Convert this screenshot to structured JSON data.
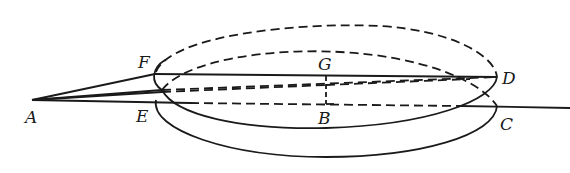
{
  "diagram": {
    "type": "geometry-figure",
    "points": {
      "A": {
        "label": "A",
        "x": 32,
        "y": 100
      },
      "F": {
        "label": "F",
        "x": 155,
        "y": 74
      },
      "E": {
        "label": "E",
        "x": 155,
        "y": 103
      },
      "G": {
        "label": "G",
        "x": 326,
        "y": 75
      },
      "B": {
        "label": "B",
        "x": 326,
        "y": 104
      },
      "D": {
        "label": "D",
        "x": 497,
        "y": 77
      },
      "C": {
        "label": "C",
        "x": 497,
        "y": 106
      }
    },
    "labels": {
      "A": "A",
      "F": "F",
      "E": "E",
      "G": "G",
      "B": "B",
      "D": "D",
      "C": "C"
    },
    "line_color": "#1a1a1a",
    "background": "#ffffff"
  }
}
